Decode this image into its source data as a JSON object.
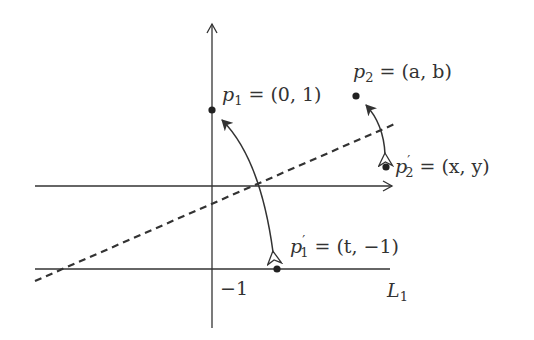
{
  "diagram": {
    "colors": {
      "line": "#333333",
      "background": "#ffffff"
    },
    "axes": {
      "x_axis": {
        "from": [
          35,
          186
        ],
        "to": [
          393,
          186
        ],
        "arrow": true
      },
      "y_axis": {
        "from": [
          212,
          328
        ],
        "to": [
          212,
          22
        ],
        "arrow": true
      }
    },
    "line_L1": {
      "label": "L",
      "subscript": "1",
      "from": [
        35,
        269
      ],
      "to": [
        390,
        269
      ]
    },
    "tick_label": {
      "text": "−1",
      "position": [
        222,
        296
      ]
    },
    "dashed_line": {
      "from": [
        35,
        281
      ],
      "to": [
        397,
        123
      ]
    },
    "points": [
      {
        "id": "p1",
        "name": "p",
        "sub": "1",
        "prime": false,
        "eq": " = (0, 1)",
        "pos": [
          212,
          110
        ]
      },
      {
        "id": "p2",
        "name": "p",
        "sub": "2",
        "prime": false,
        "eq": " = (a, b)",
        "pos": [
          356,
          96
        ]
      },
      {
        "id": "p1prime",
        "name": "p",
        "sub": "1",
        "prime": true,
        "eq": " = (t, −1)",
        "pos": [
          277,
          269
        ]
      },
      {
        "id": "p2prime",
        "name": "p",
        "sub": "2",
        "prime": true,
        "eq": " = (x, y)",
        "pos": [
          386,
          167
        ]
      }
    ],
    "labels": {
      "p1": {
        "var": "p",
        "sub": "1",
        "rest": " = (0, 1)"
      },
      "p2": {
        "var": "p",
        "sub": "2",
        "rest": " = (a, b)"
      },
      "p1prime": {
        "var": "p",
        "prime": "′",
        "sub": "1",
        "rest": " = (t, −1)"
      },
      "p2prime": {
        "var": "p",
        "prime": "′",
        "sub": "2",
        "rest": " = (x, y)"
      },
      "L1": {
        "var": "L",
        "sub": "1"
      },
      "tick": "−1"
    },
    "arrows": [
      {
        "from": "p1prime",
        "to": "p1",
        "description": "curved double-headed reflection arrow between p1 and p1'"
      },
      {
        "from": "p2",
        "to": "p2prime",
        "description": "curved double-headed reflection arrow between p2 and p2'"
      }
    ]
  }
}
